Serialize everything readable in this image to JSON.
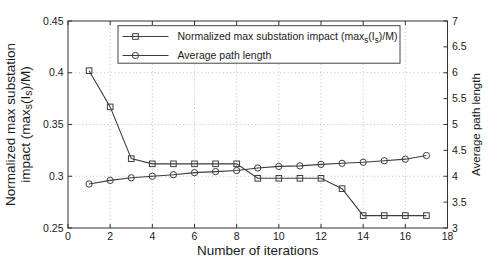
{
  "figure": {
    "width_px": 498,
    "height_px": 266,
    "background": "#ffffff"
  },
  "chart_data": {
    "type": "line",
    "title": "",
    "xlabel": "Number of iterations",
    "x_range": [
      0,
      18
    ],
    "x_ticks": [
      0,
      2,
      4,
      6,
      8,
      10,
      12,
      14,
      16,
      18
    ],
    "grid": true,
    "grid_style": "dotted",
    "legend_position": "top-inside",
    "left_axis": {
      "label_lines": [
        "Normalized max substation",
        "impact (max_{s}(I_{s})/M)"
      ],
      "range": [
        0.25,
        0.45
      ],
      "ticks": [
        0.25,
        0.3,
        0.35,
        0.4,
        0.45
      ],
      "tick_labels": [
        "0.25",
        "0.3",
        "0.35",
        "0.4",
        "0.45"
      ]
    },
    "right_axis": {
      "label": "Average path length",
      "range": [
        3,
        7
      ],
      "ticks": [
        3,
        3.5,
        4,
        4.5,
        5,
        5.5,
        6,
        6.5,
        7
      ],
      "tick_labels": [
        "3",
        "3.5",
        "4",
        "4.5",
        "5",
        "5.5",
        "6",
        "6.5",
        "7"
      ]
    },
    "x": [
      1,
      2,
      3,
      4,
      5,
      6,
      7,
      8,
      9,
      10,
      11,
      12,
      13,
      14,
      15,
      16,
      17
    ],
    "series": [
      {
        "name": "Normalized max substation impact (max_{s}(I_{s})/M)",
        "marker": "square",
        "axis": "left",
        "values": [
          0.402,
          0.367,
          0.317,
          0.312,
          0.312,
          0.312,
          0.312,
          0.312,
          0.298,
          0.298,
          0.298,
          0.298,
          0.288,
          0.262,
          0.262,
          0.262,
          0.262
        ]
      },
      {
        "name": "Average path length",
        "marker": "circle",
        "axis": "right",
        "values": [
          3.85,
          3.92,
          3.97,
          4.0,
          4.03,
          4.07,
          4.09,
          4.11,
          4.16,
          4.19,
          4.2,
          4.23,
          4.25,
          4.27,
          4.3,
          4.33,
          4.4
        ]
      }
    ],
    "colors": {
      "line": "#3d3d3d",
      "grid": "#b8b8b8",
      "frame": "#333333",
      "text": "#1a1a1a",
      "background": "#ffffff"
    }
  }
}
